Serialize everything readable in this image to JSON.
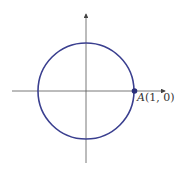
{
  "diagram": {
    "type": "unit-circle",
    "point_label_var": "A",
    "point_label_coords": "(1, 0)",
    "colors": {
      "circle": "#3a3f8f",
      "axes": "#444444",
      "point": "#2a2f7a"
    }
  }
}
